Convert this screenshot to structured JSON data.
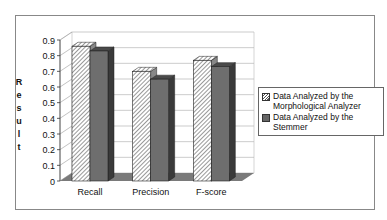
{
  "chart_data": {
    "type": "bar",
    "title": "",
    "xlabel": "",
    "ylabel": "Result",
    "ylim": [
      0,
      0.9
    ],
    "yticks": [
      "0",
      "0.1",
      "0.2",
      "0.3",
      "0.4",
      "0.5",
      "0.6",
      "0.7",
      "0.8",
      "0.9"
    ],
    "categories": [
      "Recall",
      "Precision",
      "F-score"
    ],
    "series": [
      {
        "name": "Data Analyzed by the Morphological Analyzer",
        "values": [
          0.86,
          0.7,
          0.77
        ],
        "pattern": "hatched"
      },
      {
        "name": "Data Analyzed by the Stemmer",
        "values": [
          0.83,
          0.65,
          0.73
        ],
        "pattern": "solid-gray"
      }
    ],
    "grid": true,
    "legend_position": "right",
    "style": "3d-column"
  },
  "ylabel_letters": [
    "R",
    "e",
    "s",
    "u",
    "l",
    "t"
  ],
  "legend": {
    "item0_line1": "Data Analyzed by the",
    "item0_line2": "Morphological Analyzer",
    "item1_line1": "Data Analyzed by the",
    "item1_line2": "Stemmer"
  },
  "colors": {
    "solid_bar": "#6e6e6e",
    "solid_side": "#3a3a3a",
    "floor": "#7a7a7a"
  }
}
